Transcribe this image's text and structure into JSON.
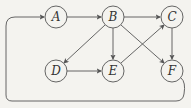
{
  "diagram": {
    "type": "directed-graph",
    "colors": {
      "background": "#f4f3ef",
      "stroke": "#555555",
      "text": "#333333"
    },
    "nodes": [
      {
        "id": "A",
        "label": "A",
        "x": 56,
        "y": 17
      },
      {
        "id": "B",
        "label": "B",
        "x": 113,
        "y": 17
      },
      {
        "id": "C",
        "label": "C",
        "x": 172,
        "y": 17
      },
      {
        "id": "D",
        "label": "D",
        "x": 56,
        "y": 71
      },
      {
        "id": "E",
        "label": "E",
        "x": 113,
        "y": 71
      },
      {
        "id": "F",
        "label": "F",
        "x": 172,
        "y": 71
      }
    ],
    "edges": [
      {
        "from": "A",
        "to": "B"
      },
      {
        "from": "B",
        "to": "C"
      },
      {
        "from": "B",
        "to": "D"
      },
      {
        "from": "B",
        "to": "E"
      },
      {
        "from": "B",
        "to": "F"
      },
      {
        "from": "C",
        "to": "F"
      },
      {
        "from": "D",
        "to": "E"
      },
      {
        "from": "E",
        "to": "C"
      },
      {
        "from": "F",
        "to": "A",
        "route": "around-bottom-left"
      }
    ]
  }
}
